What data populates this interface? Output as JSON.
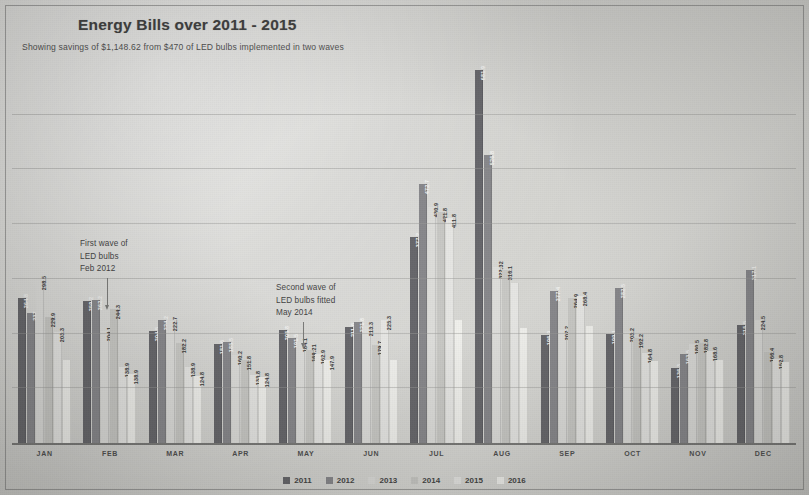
{
  "header": {
    "title": "Energy Bills over 2011 - 2015",
    "subtitle": "Showing savings of $1,148.62 from $470 of LED bulbs implemented  in two waves"
  },
  "annotations": [
    {
      "id": "first-wave",
      "line1": "First wave of",
      "line2": "LED bulbs",
      "line3": "Feb 2012"
    },
    {
      "id": "second-wave",
      "line1": "Second wave of",
      "line2": "LED bulbs fitted",
      "line3": "May 2014"
    }
  ],
  "legend": {
    "position": "bottom-center",
    "items": [
      {
        "label": "2011",
        "color": "#55555a"
      },
      {
        "label": "2012",
        "color": "#7a7a7e"
      },
      {
        "label": "2013",
        "color": "#d9d9d6"
      },
      {
        "label": "2014",
        "color": "#c2c2be"
      },
      {
        "label": "2015",
        "color": "#e3e3e0"
      },
      {
        "label": "2016",
        "color": "#eeeeea"
      }
    ]
  },
  "chart_data": {
    "type": "bar",
    "title": "Energy Bills over 2011 - 2015",
    "subtitle": "Showing savings of $1,148.62 from $470 of LED bulbs implemented  in two waves",
    "xlabel": "",
    "ylabel": "",
    "ylim": [
      0,
      700
    ],
    "grid": true,
    "grid_values": [
      100,
      200,
      300,
      400,
      500,
      600
    ],
    "categories": [
      "JAN",
      "FEB",
      "MAR",
      "APR",
      "MAY",
      "JUN",
      "JUL",
      "AUG",
      "SEP",
      "OCT",
      "NOV",
      "DEC"
    ],
    "series": [
      {
        "name": "2011",
        "color": "#55555a",
        "values": [
          264.8,
          259.2,
          204.5,
          181.6,
          205.8,
          211.6,
          377.2,
          681.9,
          196.9,
          199.1,
          136.3,
          215.5
        ]
      },
      {
        "name": "2012",
        "color": "#7a7a7e",
        "values": [
          237.0,
          262.2,
          224.2,
          185.5,
          191.5,
          221.8,
          472.7,
          526.8,
          277.4,
          282.5,
          163.5,
          317.1
        ]
      },
      {
        "name": "2013",
        "color": "#d9d9d6",
        "values": [
          298.5,
          204.1,
          222.7,
          160.2,
          184.1,
          213.3,
          430.9,
          322.32,
          207.2,
          203.2,
          180.5,
          224.5
        ]
      },
      {
        "name": "2014",
        "color": "#c2c2be",
        "values": [
          229.9,
          244.3,
          182.2,
          151.8,
          169.21,
          179.7,
          421.8,
          316.1,
          264.9,
          192.2,
          182.8,
          166.4
        ]
      },
      {
        "name": "2015",
        "color": "#e3e3e0",
        "values": [
          203.3,
          138.9,
          138.9,
          124.8,
          162.9,
          225.3,
          411.8,
          292.4,
          268.4,
          164.8,
          168.6,
          152.8
        ]
      },
      {
        "name": "2016",
        "color": "#eeeeea",
        "values": [
          151.0,
          126.4,
          122.0,
          120.0,
          151.0,
          152.0,
          224.0,
          210.0,
          214.0,
          150.0,
          151.0,
          148.0
        ]
      }
    ],
    "bar_labels": {
      "JAN": [
        "264.8",
        "237",
        "298.5",
        "229.9",
        "203.3"
      ],
      "FEB": [
        "259.2",
        "262.2",
        "204.1",
        "244.3",
        "138.9",
        "138.9"
      ],
      "MAR": [
        "204.5",
        "224.2",
        "222.7",
        "182.2",
        "138.9",
        "124.8"
      ],
      "APR": [
        "181.6",
        "185.5",
        "160.2",
        "151.8",
        "133.8",
        "124.8"
      ],
      "MAY": [
        "205.8",
        "191.5",
        "184.1",
        "169.21",
        "162.9",
        "147.9"
      ],
      "JUN": [
        "211.6",
        "221.8",
        "213.3",
        "179.7",
        "225.3"
      ],
      "JUL": [
        "377.2",
        "472.7",
        "430.9",
        "421.8",
        "411.8"
      ],
      "AUG": [
        "681.9",
        "526.8",
        "322.32",
        "316.1"
      ],
      "SEP": [
        "196.9",
        "277.4",
        "207.2",
        "264.9",
        "268.4"
      ],
      "OCT": [
        "199.1",
        "282.5",
        "203.2",
        "192.2",
        "164.8"
      ],
      "NOV": [
        "136.3",
        "163.5",
        "180.5",
        "182.8",
        "168.6"
      ],
      "DEC": [
        "215.5",
        "317.1",
        "224.5",
        "166.4",
        "152.8"
      ]
    }
  }
}
